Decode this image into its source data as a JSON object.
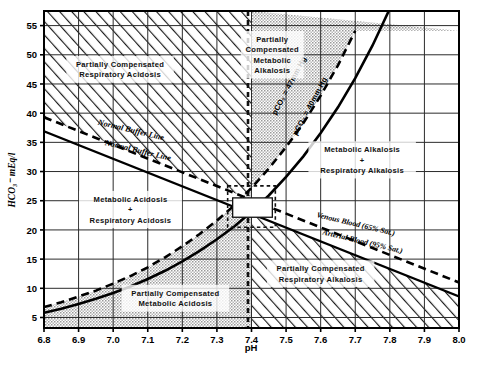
{
  "chart_data": {
    "type": "line",
    "title": "",
    "xlabel": "pH",
    "ylabel": "HCO3- mEq/l",
    "xlim": [
      6.8,
      8.0
    ],
    "ylim": [
      3.2,
      57.5
    ],
    "grid": true,
    "legend_position": "inline-annotations",
    "xticks": [
      "6.8",
      "6.9",
      "7.0",
      "7.1",
      "7.2",
      "7.3",
      "7.4",
      "7.5",
      "7.6",
      "7.7",
      "7.8",
      "7.9",
      "8.0"
    ],
    "xtick_values": [
      6.8,
      6.9,
      7.0,
      7.1,
      7.2,
      7.3,
      7.4,
      7.5,
      7.6,
      7.7,
      7.8,
      7.9,
      8.0
    ],
    "yticks": [
      "5",
      "10",
      "15",
      "20",
      "25",
      "30",
      "35",
      "40",
      "45",
      "50",
      "55"
    ],
    "ytick_values": [
      5,
      10,
      15,
      20,
      25,
      30,
      35,
      40,
      45,
      50,
      55
    ],
    "series": [
      {
        "name": "pCO2 = 40mm Hg",
        "style": "solid",
        "x": [
          6.8,
          6.85,
          6.9,
          6.95,
          7.0,
          7.05,
          7.1,
          7.15,
          7.2,
          7.25,
          7.3,
          7.35,
          7.4,
          7.45,
          7.5,
          7.55,
          7.6,
          7.65,
          7.7,
          7.75,
          7.8
        ],
        "y": [
          5.8,
          6.5,
          7.3,
          8.2,
          9.2,
          10.3,
          11.6,
          13.0,
          14.6,
          16.4,
          18.4,
          20.6,
          23.1,
          25.9,
          29.1,
          32.6,
          36.6,
          41.0,
          46.0,
          51.6,
          57.9
        ]
      },
      {
        "name": "pCO2 = 47mm Hg",
        "style": "dashed",
        "x": [
          6.8,
          6.85,
          6.9,
          6.95,
          7.0,
          7.05,
          7.1,
          7.15,
          7.2,
          7.25,
          7.3,
          7.35,
          7.4,
          7.45,
          7.5,
          7.55,
          7.6,
          7.65,
          7.7
        ],
        "y": [
          6.8,
          7.6,
          8.6,
          9.6,
          10.8,
          12.1,
          13.6,
          15.3,
          17.2,
          19.3,
          21.6,
          24.2,
          27.2,
          30.5,
          34.2,
          38.3,
          43.0,
          48.2,
          54.1
        ]
      },
      {
        "name": "Normal Buffer Line (arterial)",
        "style": "solid",
        "x": [
          6.8,
          8.0
        ],
        "y": [
          36.9,
          8.6
        ]
      },
      {
        "name": "Normal Buffer Line (venous)",
        "style": "dashed",
        "x": [
          6.8,
          8.0
        ],
        "y": [
          39.3,
          11.0
        ]
      }
    ],
    "annotations": [
      {
        "name": "partially-compensated-respiratory-acidosis",
        "text": [
          "Partially Compensated",
          "Respiratory Acidosis"
        ],
        "x": 7.02,
        "y": 47.5
      },
      {
        "name": "partially-compensated-metabolic-alkalosis",
        "text": [
          "Partially",
          "Compensated",
          "Metabolic",
          "Alkalosis"
        ],
        "x": 7.46,
        "y": 50.0
      },
      {
        "name": "metabolic-alkalosis-plus-respiratory-alkalosis",
        "text": [
          "Metabolic Alkalosis",
          "+",
          "Respiratory Alkalosis"
        ],
        "x": 7.72,
        "y": 32.0
      },
      {
        "name": "metabolic-acidosis-plus-respiratory-acidosis",
        "text": [
          "Metabolic Acidosis",
          "+",
          "Respiratory Acidosis"
        ],
        "x": 7.05,
        "y": 23.5
      },
      {
        "name": "partially-compensated-respiratory-alkalosis",
        "text": [
          "Partially Compensated",
          "Respiratory Alkalosis"
        ],
        "x": 7.6,
        "y": 12.5
      },
      {
        "name": "partially-compensated-metabolic-acidosis",
        "text": [
          "Partially Compensated",
          "Metabolic Acidosis"
        ],
        "x": 7.18,
        "y": 8.3
      }
    ],
    "curve_labels": [
      {
        "name": "pco2-47-label",
        "text": "pCO₂ = 47mm Hg"
      },
      {
        "name": "pco2-40-label",
        "text": "pCO₂ = 40mm Hg"
      },
      {
        "name": "normal-buffer-line-venous-label",
        "text": "Normal Buffer Line"
      },
      {
        "name": "normal-buffer-line-arterial-label",
        "text": "Normal Buffer Line"
      },
      {
        "name": "venous-blood-label",
        "text": "Venous Blood (65% Sat.)"
      },
      {
        "name": "arterial-blood-label",
        "text": "Arterial Blood (95% Sat.)"
      }
    ],
    "reference_lines": [
      {
        "name": "ph-74-vertical-dashed",
        "x": 7.4,
        "style": "dashed"
      }
    ],
    "normal_range_box": {
      "name": "normal-range-marker",
      "x_range": [
        7.36,
        7.44
      ],
      "y_range": [
        22.0,
        26.0
      ]
    },
    "colors": {
      "plot_background": "#ffffff",
      "hatch_fill": "#d9d9d9",
      "stipple_fill": "#cfcfcf",
      "grid": "#2b2b2b",
      "axis": "#000000",
      "curve": "#000000"
    }
  },
  "axis": {
    "x_title": "pH",
    "y_title": "HCO₃⁻ mEq/l"
  }
}
